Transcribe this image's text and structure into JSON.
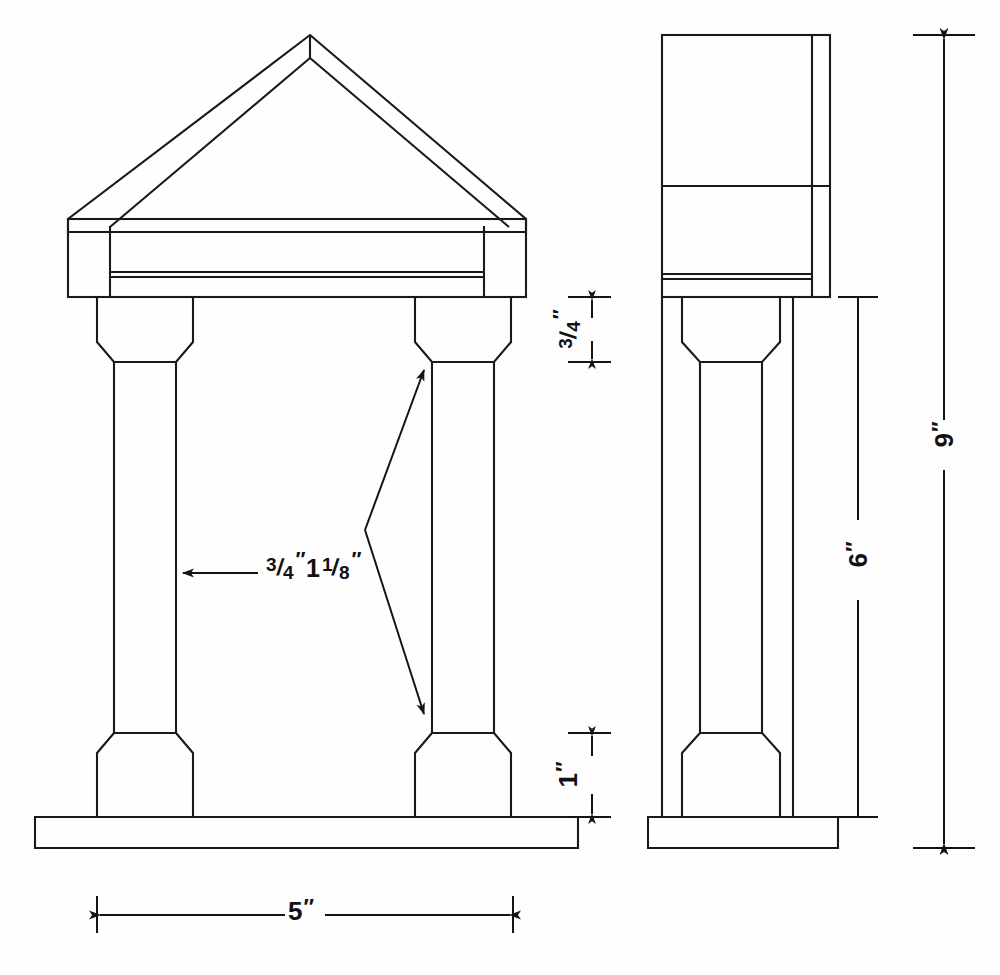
{
  "drawing": {
    "title": "Pediment and Column Assembly",
    "line_color": "#1a1a1a",
    "background_color": "#fefefe",
    "views": [
      {
        "name": "front-elevation",
        "label": "Front Elevation"
      },
      {
        "name": "side-elevation",
        "label": "Side Elevation"
      }
    ]
  },
  "dimensions": {
    "entablature_height": {
      "id": "dim-three-quarter-vertical",
      "whole": "",
      "numerator": "3",
      "denominator": "4",
      "unit": "″",
      "text": "3/4″",
      "orientation": "vertical",
      "value_inches": 0.75
    },
    "column_width": {
      "id": "dim-three-quarter-column",
      "whole": "",
      "numerator": "3",
      "denominator": "4",
      "unit": "″",
      "text": "3/4″",
      "orientation": "horizontal",
      "value_inches": 0.75
    },
    "capital_width": {
      "id": "dim-one-and-one-eighth",
      "whole": "1",
      "numerator": "1",
      "denominator": "8",
      "unit": "″",
      "text": "1⅛″",
      "orientation": "leader",
      "value_inches": 1.125
    },
    "base_height": {
      "id": "dim-one-inch",
      "text": "1",
      "unit": "″",
      "orientation": "vertical",
      "value_inches": 1
    },
    "overall_width": {
      "id": "dim-five-inch",
      "text": "5",
      "unit": "″",
      "orientation": "horizontal",
      "value_inches": 5
    },
    "column_height": {
      "id": "dim-six-inch",
      "text": "6",
      "unit": "″",
      "orientation": "vertical",
      "value_inches": 6
    },
    "overall_height": {
      "id": "dim-nine-inch",
      "text": "9",
      "unit": "″",
      "orientation": "vertical",
      "value_inches": 9
    }
  },
  "caption": {
    "text": ""
  }
}
